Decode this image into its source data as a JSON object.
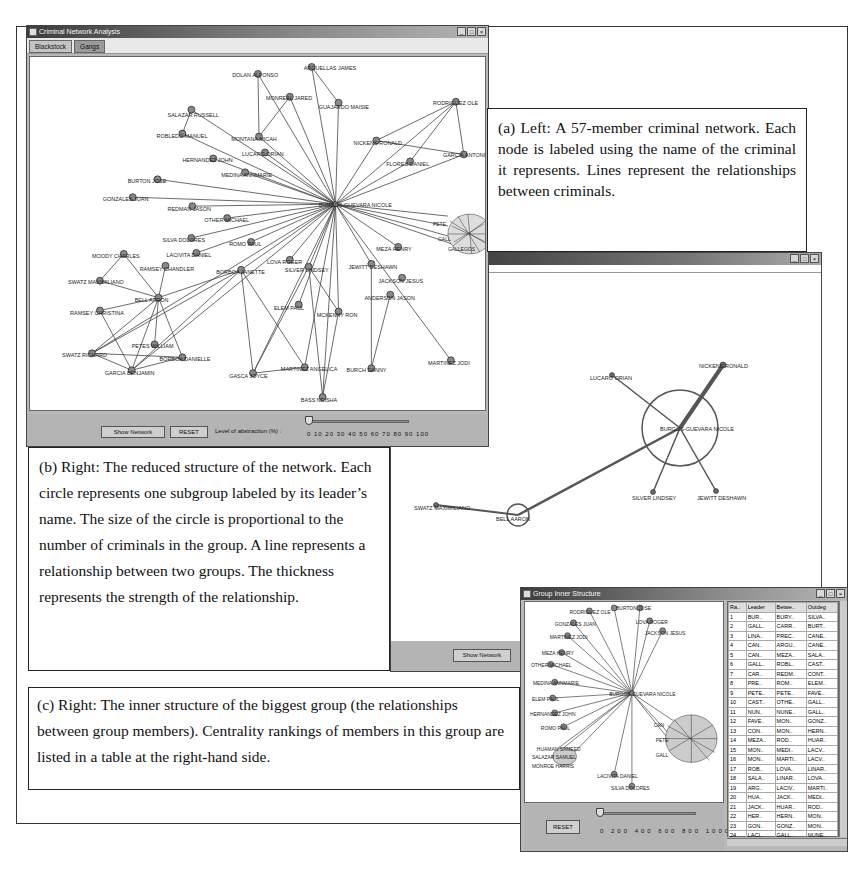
{
  "main_window": {
    "title": "Criminal Network Analysis",
    "tabs": [
      {
        "label": "Blackstock",
        "active": true
      },
      {
        "label": "Gangs",
        "active": false
      }
    ],
    "controls": {
      "show_network_label": "Show Network",
      "reset_label": "RESET",
      "abstraction_label": "Level of abstraction (%) :",
      "slider_ticks": "0 10 20 30 40 50 60 70 80 90 100",
      "slider_value": 0
    },
    "nodes": [
      {
        "id": "dolan",
        "label": "DOLAN ALFONSO",
        "x": 229,
        "y": 17
      },
      {
        "id": "arguellas",
        "label": "ARGUELLAS JAMES",
        "x": 283,
        "y": 10
      },
      {
        "id": "monreal",
        "label": "MONREAL JARED",
        "x": 261,
        "y": 40
      },
      {
        "id": "guajardo",
        "label": "GUAJARDO MAISIE",
        "x": 310,
        "y": 46
      },
      {
        "id": "salazar",
        "label": "SALAZAR RUSSELL",
        "x": 162,
        "y": 53
      },
      {
        "id": "robledo",
        "label": "ROBLEDO MANUEL",
        "x": 153,
        "y": 77
      },
      {
        "id": "montana",
        "label": "MONTANA MICAH",
        "x": 230,
        "y": 80
      },
      {
        "id": "lucaro",
        "label": "LUCARO ORIAN",
        "x": 236,
        "y": 96
      },
      {
        "id": "hernandez",
        "label": "HERNANDEZ JOHN",
        "x": 184,
        "y": 102
      },
      {
        "id": "medina",
        "label": "MEDINA ANNMARIE",
        "x": 216,
        "y": 116
      },
      {
        "id": "burton",
        "label": "BURTON JOSE",
        "x": 128,
        "y": 123
      },
      {
        "id": "gonzales",
        "label": "GONZALES JUAN",
        "x": 103,
        "y": 141
      },
      {
        "id": "redman",
        "label": "REDMAN JASON",
        "x": 163,
        "y": 150
      },
      {
        "id": "other",
        "label": "OTHER MICHAEL",
        "x": 198,
        "y": 162
      },
      {
        "id": "silva",
        "label": "SILVA DOLORES",
        "x": 162,
        "y": 182
      },
      {
        "id": "romo",
        "label": "ROMO PAUL",
        "x": 222,
        "y": 186
      },
      {
        "id": "lacivita",
        "label": "LACIVITA DANIEL",
        "x": 167,
        "y": 197
      },
      {
        "id": "center",
        "label": "BURGOS-GUEVARA NICOLE",
        "x": 307,
        "y": 148
      },
      {
        "id": "rodriguez",
        "label": "RODRIGUEZ OLE",
        "x": 428,
        "y": 45
      },
      {
        "id": "nickens",
        "label": "NICKENS RONALD",
        "x": 348,
        "y": 84
      },
      {
        "id": "flores",
        "label": "FLORES DANIEL",
        "x": 382,
        "y": 105
      },
      {
        "id": "garcia_a",
        "label": "GARCIA ANTONIO",
        "x": 436,
        "y": 98
      },
      {
        "id": "meza",
        "label": "MEZA HENRY",
        "x": 370,
        "y": 191
      },
      {
        "id": "moody",
        "label": "MOODY CHARLES",
        "x": 94,
        "y": 198
      },
      {
        "id": "ramsey_c",
        "label": "RAMSEY CHANDLER",
        "x": 136,
        "y": 210
      },
      {
        "id": "swatz",
        "label": "SWATZ MAXIMILIANO",
        "x": 70,
        "y": 225
      },
      {
        "id": "bell",
        "label": "BELL AARON",
        "x": 129,
        "y": 242
      },
      {
        "id": "ramsey_ch",
        "label": "RAMSEY CHRISTINA",
        "x": 70,
        "y": 255
      },
      {
        "id": "borboa",
        "label": "BORBOA JANETTE",
        "x": 212,
        "y": 214
      },
      {
        "id": "lova",
        "label": "LOVA ROGER",
        "x": 261,
        "y": 204
      },
      {
        "id": "silver",
        "label": "SILVER LINDSEY",
        "x": 280,
        "y": 211
      },
      {
        "id": "jewitt",
        "label": "JEWITT DESHAWN",
        "x": 343,
        "y": 208
      },
      {
        "id": "jackson",
        "label": "JACKSON JESUS",
        "x": 374,
        "y": 222
      },
      {
        "id": "anderson",
        "label": "ANDERSON JASON",
        "x": 362,
        "y": 239
      },
      {
        "id": "elem",
        "label": "ELEM PAUL",
        "x": 270,
        "y": 249
      },
      {
        "id": "mckenny",
        "label": "MCKENNY RON",
        "x": 310,
        "y": 256
      },
      {
        "id": "petes",
        "label": "PETES WILLIAM",
        "x": 125,
        "y": 289
      },
      {
        "id": "swatz_r",
        "label": "SWATZ RICHARD",
        "x": 62,
        "y": 298
      },
      {
        "id": "borboa_d",
        "label": "BORBOA DANIELLE",
        "x": 153,
        "y": 302
      },
      {
        "id": "garcia_b",
        "label": "GARCIA BENJAMIN",
        "x": 102,
        "y": 315
      },
      {
        "id": "gasca",
        "label": "GASCA JOYCE",
        "x": 224,
        "y": 318
      },
      {
        "id": "martinez_a",
        "label": "MARTINEZ ANGELICA",
        "x": 276,
        "y": 312
      },
      {
        "id": "burch",
        "label": "BURCH DANNY",
        "x": 343,
        "y": 313
      },
      {
        "id": "martinez_j",
        "label": "MARTINEZ JODI",
        "x": 423,
        "y": 305
      },
      {
        "id": "bass",
        "label": "BASS NEISHA",
        "x": 294,
        "y": 342
      },
      {
        "id": "gall",
        "label": "GALLEGOS DE LEON",
        "x": 436,
        "y": 180
      }
    ],
    "cluster_labels": [
      "PETE",
      "GALL",
      "GALLEGOS"
    ]
  },
  "reduced_window": {
    "groups": [
      {
        "label": "BURGOS-GUEVARA NICOLE",
        "x": 680,
        "y": 428,
        "radius": 38
      },
      {
        "label": "BELL AARON",
        "x": 518,
        "y": 515,
        "radius": 11
      }
    ],
    "nodes": [
      {
        "label": "NICKENS RONALD",
        "x": 723,
        "y": 365
      },
      {
        "label": "LUCARO ORIAN",
        "x": 612,
        "y": 375
      },
      {
        "label": "SILVER LINDSEY",
        "x": 653,
        "y": 492
      },
      {
        "label": "JEWITT DESHAWN",
        "x": 716,
        "y": 491
      },
      {
        "label": "SWATZ MAXIMILIANO",
        "x": 436,
        "y": 505
      }
    ],
    "show_network_label": "Show Network"
  },
  "inner_window": {
    "title": "Group Inner Structure",
    "reset_label": "RESET",
    "slider_ticks": "0 200 400 600 800 1000",
    "slider_value": 0,
    "center_label": "BURGOS-GUEVARA NICOLE",
    "nodes": [
      {
        "label": "RODRIGUEZ OLE",
        "x": 585,
        "y": 609
      },
      {
        "label": "BURTON JOSE",
        "x": 610,
        "y": 606
      },
      {
        "label": "GONZALES JUAN",
        "x": 569,
        "y": 621
      },
      {
        "label": "LOVA ROGER",
        "x": 646,
        "y": 619
      },
      {
        "label": "JACKSON JESUS",
        "x": 659,
        "y": 629
      },
      {
        "label": "MARTINEZ JODI",
        "x": 563,
        "y": 634
      },
      {
        "label": "MEZA HENRY",
        "x": 557,
        "y": 651
      },
      {
        "label": "OTHER MICHAEL",
        "x": 546,
        "y": 663
      },
      {
        "label": "MEDINA ANNMARIE",
        "x": 550,
        "y": 681
      },
      {
        "label": "ELEM PAUL",
        "x": 548,
        "y": 697
      },
      {
        "label": "HERNANDEZ JOHN",
        "x": 550,
        "y": 712
      },
      {
        "label": "ROMO PAUL",
        "x": 559,
        "y": 726
      },
      {
        "label": "HUAMAN SAMEED",
        "x": 553,
        "y": 748
      },
      {
        "label": "SALAZAR SAMUEL",
        "x": 547,
        "y": 757
      },
      {
        "label": "MONROE HARRIS",
        "x": 556,
        "y": 766
      },
      {
        "label": "LACIVITA DANIEL",
        "x": 610,
        "y": 774
      },
      {
        "label": "SILVA DOLORES",
        "x": 628,
        "y": 786
      },
      {
        "label": "PETE",
        "x": 658,
        "y": 736
      },
      {
        "label": "CAN",
        "x": 654,
        "y": 723
      },
      {
        "label": "GALL",
        "x": 660,
        "y": 756
      }
    ],
    "table": {
      "columns": [
        "Ra..",
        "Leader",
        "Betwe..",
        "Outdeg"
      ],
      "rows": [
        [
          "1",
          "BUR..",
          "BURY..",
          "SILVA.."
        ],
        [
          "2",
          "GALL..",
          "CARR..",
          "BURT.."
        ],
        [
          "3",
          "LINA..",
          "PREC..",
          "CANE.."
        ],
        [
          "4",
          "CAN..",
          "ARGU..",
          "CANE.."
        ],
        [
          "5",
          "CAN..",
          "MEZA..",
          "SALA.."
        ],
        [
          "6",
          "GALL..",
          "ROBL..",
          "CAST.."
        ],
        [
          "7",
          "CAR..",
          "REDM..",
          "CONT.."
        ],
        [
          "8",
          "PRE..",
          "ROM..",
          "ELEM.."
        ],
        [
          "9",
          "PETE..",
          "PETE..",
          "FAVE.."
        ],
        [
          "10",
          "CAST..",
          "OTHE..",
          "GALL.."
        ],
        [
          "11",
          "NUN..",
          "NUNE..",
          "GALL.."
        ],
        [
          "12",
          "FAVE..",
          "MON..",
          "GONZ.."
        ],
        [
          "13",
          "CON..",
          "MON..",
          "HERN.."
        ],
        [
          "14",
          "MEZA..",
          "ROD..",
          "HUAR.."
        ],
        [
          "15",
          "MON..",
          "MEDI..",
          "LACV.."
        ],
        [
          "16",
          "MON..",
          "MARTI..",
          "LACV.."
        ],
        [
          "17",
          "ROB..",
          "LOVA..",
          "LINAR.."
        ],
        [
          "18",
          "SALA..",
          "LINAR..",
          "LOVA.."
        ],
        [
          "19",
          "ARG..",
          "LACIV..",
          "MARTI.."
        ],
        [
          "20",
          "HUA..",
          "JACK..",
          "MEDI.."
        ],
        [
          "21",
          "JACK..",
          "HUAR..",
          "ROD.."
        ],
        [
          "22",
          "HER..",
          "HERN..",
          "MON.."
        ],
        [
          "23",
          "GON..",
          "GONZ..",
          "MON.."
        ],
        [
          "24",
          "LACI..",
          "GALL..",
          "NUNE.."
        ]
      ]
    }
  },
  "captions": {
    "a": "(a) Left: A 57-member criminal network. Each node is labeled using the name of the criminal it represents. Lines represent the relationships between criminals.",
    "b": "(b) Right: The reduced structure of the network. Each circle represents one subgroup labeled by its leader’s name. The size of the circle is proportional to the number of criminals in the group. A line represents a relationship between two groups. The thickness represents the strength of the relationship.",
    "c": "(c) Right: The inner structure of the biggest group (the relationships between group members). Centrality rankings of members in this group are listed in a table at the right-hand side."
  },
  "window_buttons": {
    "minimize": "_",
    "maximize": "□",
    "close": "×"
  }
}
